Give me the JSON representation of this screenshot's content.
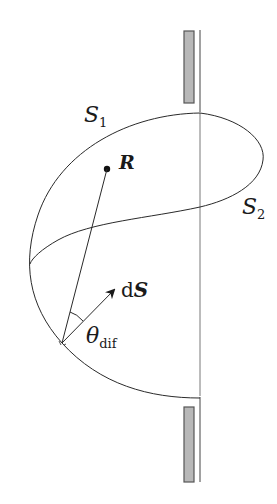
{
  "figure": {
    "labels": {
      "s1_main": "S",
      "s1_sub": "1",
      "s2_main": "S",
      "s2_sub": "2",
      "point_r": "R",
      "ds_prefix": "d",
      "ds_vec": "S",
      "theta_main": "θ",
      "theta_sub": "dif"
    },
    "colors": {
      "line": "#2a2a2a",
      "screen_fill": "#b8b8b8",
      "screen_stroke": "#555555",
      "aperture_line": "#6a6a6a"
    }
  }
}
